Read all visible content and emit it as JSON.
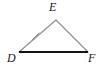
{
  "figure": {
    "kind": "geometry-diagram",
    "shape": "triangle",
    "name": "triangle-DEF",
    "background_color": "#ffffff",
    "labels": [
      {
        "id": "E",
        "text": "E",
        "x": 56,
        "y": 8,
        "role": "apex-vertex-label"
      },
      {
        "id": "D",
        "text": "D",
        "x": 12,
        "y": 58,
        "role": "bottom-left-vertex-label"
      },
      {
        "id": "F",
        "text": "F",
        "x": 92,
        "y": 58,
        "role": "bottom-right-vertex-label"
      }
    ],
    "vertices": [
      {
        "id": "D",
        "x": 19,
        "y": 52
      },
      {
        "id": "E",
        "x": 56,
        "y": 20
      },
      {
        "id": "F",
        "x": 88,
        "y": 52
      }
    ],
    "segments": [
      {
        "id": "DE",
        "from": "D",
        "to": "E",
        "x1": 19,
        "y1": 52,
        "x2": 56,
        "y2": 20,
        "color": "#8c8c8c",
        "width": 1.1,
        "tick_count": 1
      },
      {
        "id": "EF",
        "from": "E",
        "to": "F",
        "x1": 56,
        "y1": 20,
        "x2": 88,
        "y2": 52,
        "color": "#8c8c8c",
        "width": 1.1,
        "tick_count": 1
      },
      {
        "id": "DF",
        "from": "D",
        "to": "F",
        "x1": 19,
        "y1": 52,
        "x2": 88,
        "y2": 52,
        "color": "#141414",
        "width": 2.2,
        "tick_count": 0
      }
    ],
    "tick_marks": [
      {
        "id": "tick-DE",
        "on_segment": "DE",
        "x1": 32,
        "y1": 40,
        "x2": 39,
        "y2": 33,
        "color": "#8c8c8c",
        "width": 1.0
      },
      {
        "id": "tick-EF",
        "on_segment": "EF",
        "x1": 69,
        "y1": 33,
        "x2": 76,
        "y2": 40,
        "color": "#8c8c8c",
        "width": 1.0
      }
    ]
  }
}
